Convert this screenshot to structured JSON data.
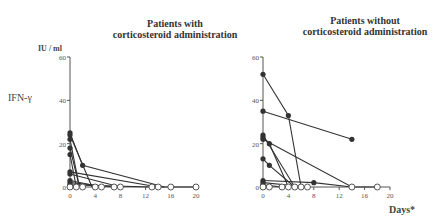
{
  "chart_data": [
    {
      "type": "line",
      "title": "Patients with corticosteroid administration",
      "title_lines": [
        "Patients with",
        "corticosteroid administration"
      ],
      "ylabel": "IFN-γ",
      "yunit": "IU / ml",
      "xlabel": "",
      "ylim": [
        0,
        60
      ],
      "xlim": [
        0,
        20
      ],
      "yticks": [
        0,
        20,
        40,
        60
      ],
      "xticks": [
        0,
        4,
        8,
        12,
        16,
        20
      ],
      "series": [
        {
          "name": "patient-1",
          "points": [
            [
              0,
              25
            ],
            [
              2,
              10
            ],
            [
              15,
              0
            ]
          ]
        },
        {
          "name": "patient-2",
          "points": [
            [
              0,
              24
            ],
            [
              3.5,
              0
            ]
          ]
        },
        {
          "name": "patient-3",
          "points": [
            [
              0,
              22
            ],
            [
              1.5,
              0
            ]
          ]
        },
        {
          "name": "patient-4",
          "points": [
            [
              0,
              18
            ],
            [
              1.5,
              0
            ]
          ]
        },
        {
          "name": "patient-5",
          "points": [
            [
              0,
              15
            ],
            [
              1,
              0
            ]
          ]
        },
        {
          "name": "patient-6",
          "points": [
            [
              0,
              7
            ],
            [
              14,
              0
            ],
            [
              16,
              0
            ],
            [
              20,
              0
            ]
          ]
        },
        {
          "name": "patient-7",
          "points": [
            [
              0,
              6
            ],
            [
              8,
              0
            ]
          ]
        },
        {
          "name": "patient-8",
          "points": [
            [
              0,
              3
            ],
            [
              5,
              0
            ]
          ]
        },
        {
          "name": "patient-9",
          "points": [
            [
              0,
              2
            ],
            [
              7,
              0
            ]
          ]
        },
        {
          "name": "patient-10",
          "points": [
            [
              0,
              1
            ],
            [
              13,
              0
            ]
          ]
        },
        {
          "name": "patient-11",
          "points": [
            [
              0,
              0.5
            ],
            [
              2,
              0
            ]
          ]
        }
      ],
      "open_points_x": [
        0,
        1,
        2,
        4,
        5,
        7,
        8,
        13,
        14,
        16,
        20
      ]
    },
    {
      "type": "line",
      "title": "Patients without corticosteroid administration",
      "title_lines": [
        "Patients without",
        "corticosteroid administration"
      ],
      "xlabel": "Days*",
      "ylim": [
        0,
        60
      ],
      "xlim": [
        0,
        20
      ],
      "yticks": [
        0,
        20,
        40,
        60
      ],
      "xticks": [
        0,
        4,
        8,
        12,
        16,
        20
      ],
      "series": [
        {
          "name": "patient-1",
          "points": [
            [
              0,
              52
            ],
            [
              4,
              33
            ],
            [
              6,
              0
            ]
          ]
        },
        {
          "name": "patient-2",
          "points": [
            [
              0,
              35
            ],
            [
              14,
              22
            ]
          ]
        },
        {
          "name": "patient-3",
          "points": [
            [
              0,
              24
            ],
            [
              5,
              0
            ]
          ]
        },
        {
          "name": "patient-4",
          "points": [
            [
              0,
              23
            ],
            [
              1,
              20
            ],
            [
              4,
              0
            ]
          ]
        },
        {
          "name": "patient-5",
          "points": [
            [
              0,
              22
            ],
            [
              14,
              0
            ],
            [
              18,
              0
            ]
          ]
        },
        {
          "name": "patient-6",
          "points": [
            [
              0,
              13
            ],
            [
              1,
              10
            ],
            [
              5,
              0
            ]
          ]
        },
        {
          "name": "patient-7",
          "points": [
            [
              0,
              3
            ],
            [
              8,
              2
            ],
            [
              14,
              0
            ]
          ]
        },
        {
          "name": "patient-8",
          "points": [
            [
              0,
              2
            ],
            [
              7,
              0
            ]
          ]
        },
        {
          "name": "patient-9",
          "points": [
            [
              0,
              1
            ],
            [
              3,
              0
            ]
          ]
        },
        {
          "name": "patient-10",
          "points": [
            [
              0,
              0.5
            ],
            [
              1,
              0
            ]
          ]
        }
      ],
      "open_points_x": [
        0,
        1,
        3,
        4,
        5,
        6,
        7,
        14,
        18
      ]
    }
  ],
  "labels": {
    "left_title_1": "Patients with",
    "left_title_2": "corticosteroid administration",
    "right_title_1": "Patients without",
    "right_title_2": "corticosteroid administration",
    "unit": "IU / ml",
    "ylabel": "IFN-γ",
    "xlabel": "Days*"
  }
}
